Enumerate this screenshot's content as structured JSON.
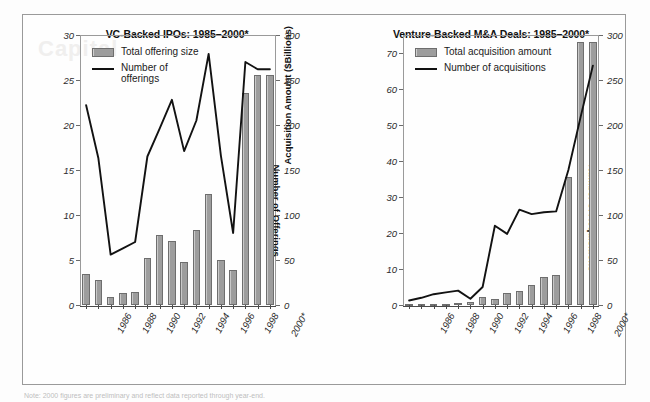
{
  "figure": {
    "watermark": "Capital",
    "footnote": "Note: 2000 figures are preliminary and reflect data reported through year-end."
  },
  "charts": [
    {
      "id": "vc-backed-ipos",
      "title": "VC-Backed IPOs: 1985–2000*",
      "legend": [
        {
          "type": "bar",
          "label": "Total offering size"
        },
        {
          "type": "line",
          "label": "Number of offerings"
        }
      ],
      "chart_data": {
        "type": "bar",
        "title": "VC-Backed IPOs: 1985–2000*",
        "xlabel": "",
        "ylabel": "Offering Size ($Billions)",
        "y2label": "Number of Offerings",
        "ylim": [
          0,
          30
        ],
        "y2lim": [
          0,
          300
        ],
        "yticks": [
          0,
          5,
          10,
          15,
          20,
          25,
          30
        ],
        "y2ticks": [
          0,
          50,
          100,
          150,
          200,
          250,
          300
        ],
        "grid": false,
        "legend_position": "top-left",
        "categories": [
          "1985",
          "1986",
          "1987",
          "1988",
          "1989",
          "1990",
          "1991",
          "1992",
          "1993",
          "1994",
          "1995",
          "1996",
          "1997",
          "1998",
          "1999",
          "2000*"
        ],
        "tick_labels": [
          "1986",
          "1988",
          "1990",
          "1992",
          "1994",
          "1996",
          "1998",
          "2000*"
        ],
        "series": [
          {
            "name": "Total offering size",
            "axis": "left",
            "type": "bar",
            "values": [
              3.4,
              2.8,
              0.9,
              1.3,
              1.5,
              5.2,
              7.8,
              7.1,
              4.8,
              8.3,
              12.3,
              5.0,
              3.9,
              23.6,
              25.6,
              25.6
            ]
          },
          {
            "name": "Number of offerings",
            "axis": "right",
            "type": "line",
            "values": [
              222,
              163,
              56,
              63,
              70,
              165,
              196,
              228,
              171,
              205,
              279,
              166,
              80,
              270,
              262,
              262
            ]
          }
        ]
      }
    },
    {
      "id": "venture-backed-ma",
      "title": "Venture-Backed M&A Deals: 1985–2000*",
      "legend": [
        {
          "type": "bar",
          "label": "Total acquisition amount"
        },
        {
          "type": "line",
          "label": "Number of acquisitions"
        }
      ],
      "chart_data": {
        "type": "bar",
        "title": "Venture-Backed M&A Deals: 1985–2000*",
        "xlabel": "",
        "ylabel": "Acquisition Amount ($Billions)",
        "y2label": "Number of Acquisitions",
        "ylim": [
          0,
          75
        ],
        "y2lim": [
          0,
          300
        ],
        "yticks": [
          0,
          10,
          20,
          30,
          40,
          50,
          60,
          70
        ],
        "y2ticks": [
          0,
          50,
          100,
          150,
          200,
          250,
          300
        ],
        "grid": false,
        "legend_position": "top-left",
        "categories": [
          "1985",
          "1986",
          "1987",
          "1988",
          "1989",
          "1990",
          "1991",
          "1992",
          "1993",
          "1994",
          "1995",
          "1996",
          "1997",
          "1998",
          "1999",
          "2000*"
        ],
        "tick_labels": [
          "1986",
          "1988",
          "1990",
          "1992",
          "1994",
          "1996",
          "1998",
          "2000*"
        ],
        "series": [
          {
            "name": "Total acquisition amount",
            "axis": "left",
            "type": "bar",
            "values": [
              0.2,
              0.3,
              0.4,
              0.4,
              0.5,
              0.8,
              2.2,
              1.6,
              3.2,
              3.8,
              5.5,
              7.9,
              8.4,
              35.5,
              73.0,
              73.0
            ]
          },
          {
            "name": "Number of acquisitions",
            "axis": "right",
            "type": "line",
            "values": [
              5,
              8,
              12,
              14,
              16,
              7,
              20,
              88,
              79,
              106,
              101,
              103,
              104,
              150,
              209,
              266
            ]
          }
        ]
      }
    }
  ]
}
